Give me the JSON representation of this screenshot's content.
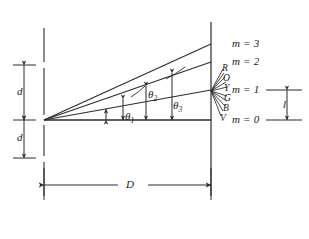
{
  "figure": {
    "domain_type": "diagram",
    "title_text": "",
    "stroke_color": "#2b2b2b",
    "background_color": "#ffffff"
  },
  "orders": [
    {
      "id": "m3",
      "label_prefix": "m",
      "equals": "=",
      "value": "3",
      "text": "m = 3",
      "screen_y": 44
    },
    {
      "id": "m2",
      "label_prefix": "m",
      "equals": "=",
      "value": "2",
      "text": "m = 2",
      "screen_y": 62
    },
    {
      "id": "m1",
      "label_prefix": "m",
      "equals": "=",
      "value": "1",
      "text": "m = 1",
      "screen_y": 90
    },
    {
      "id": "m0",
      "label_prefix": "m",
      "equals": "=",
      "value": "0",
      "text": "m = 0",
      "screen_y": 120
    }
  ],
  "angles": [
    {
      "id": "theta1",
      "base": "θ",
      "sub": "1"
    },
    {
      "id": "theta2",
      "base": "θ",
      "sub": "2"
    },
    {
      "id": "theta3",
      "base": "θ",
      "sub": "3"
    }
  ],
  "dimensions": {
    "slit_spacing_upper": "d",
    "slit_spacing_lower": "d",
    "grating_to_screen": "D",
    "fringe_separation": "l"
  },
  "spectrum": {
    "caption": "",
    "components": [
      {
        "letter": "R",
        "name": "red"
      },
      {
        "letter": "O",
        "name": "orange"
      },
      {
        "letter": "Y",
        "name": "yellow"
      },
      {
        "letter": "G",
        "name": "green"
      },
      {
        "letter": "B",
        "name": "blue"
      },
      {
        "letter": "V",
        "name": "violet"
      }
    ]
  }
}
